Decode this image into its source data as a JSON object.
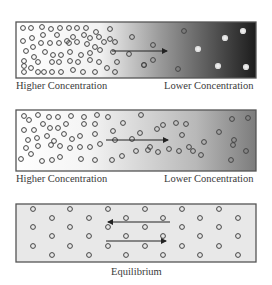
{
  "panels": [
    {
      "id": "diffusion-start",
      "box": {
        "x": 16,
        "y": 22,
        "w": 240,
        "h": 56
      },
      "gradient": {
        "stops": [
          [
            "0",
            "#ffffff"
          ],
          [
            "0.35",
            "#f2f2f2"
          ],
          [
            "0.6",
            "#9a9a9a"
          ],
          [
            "1",
            "#1c1c1c"
          ]
        ]
      },
      "labels": {
        "left": "Higher Concentration",
        "right": "Lower Concentration"
      },
      "arrows": [
        {
          "x1": 112,
          "y1": 51,
          "x2": 167,
          "y2": 51,
          "dir": "right"
        }
      ],
      "particles": [
        [
          23,
          28
        ],
        [
          31,
          28
        ],
        [
          42,
          27
        ],
        [
          51,
          29
        ],
        [
          60,
          28
        ],
        [
          69,
          28
        ],
        [
          77,
          28
        ],
        [
          86,
          28
        ],
        [
          96,
          32
        ],
        [
          110,
          29
        ],
        [
          23,
          41
        ],
        [
          32,
          38
        ],
        [
          43,
          35
        ],
        [
          57,
          35
        ],
        [
          67,
          41
        ],
        [
          73,
          37
        ],
        [
          84,
          35
        ],
        [
          90,
          38
        ],
        [
          99,
          37
        ],
        [
          110,
          39
        ],
        [
          132,
          37
        ],
        [
          26,
          51
        ],
        [
          33,
          47
        ],
        [
          41,
          43
        ],
        [
          50,
          43
        ],
        [
          59,
          43
        ],
        [
          69,
          43
        ],
        [
          77,
          42
        ],
        [
          87,
          44
        ],
        [
          95,
          47
        ],
        [
          104,
          42
        ],
        [
          115,
          42
        ],
        [
          24,
          61
        ],
        [
          34,
          57
        ],
        [
          45,
          52
        ],
        [
          53,
          55
        ],
        [
          61,
          55
        ],
        [
          70,
          52
        ],
        [
          81,
          55
        ],
        [
          90,
          53
        ],
        [
          100,
          50
        ],
        [
          113,
          52
        ],
        [
          153,
          45
        ],
        [
          24,
          66
        ],
        [
          38,
          62
        ],
        [
          52,
          62
        ],
        [
          59,
          62
        ],
        [
          70,
          61
        ],
        [
          78,
          62
        ],
        [
          90,
          60
        ],
        [
          99,
          62
        ],
        [
          117,
          62
        ],
        [
          129,
          54
        ],
        [
          24,
          72
        ],
        [
          31,
          68
        ],
        [
          38,
          72
        ],
        [
          44,
          72
        ],
        [
          52,
          72
        ],
        [
          61,
          72
        ],
        [
          73,
          70
        ],
        [
          83,
          72
        ],
        [
          95,
          72
        ],
        [
          107,
          68
        ],
        [
          115,
          72
        ],
        [
          144,
          65
        ],
        [
          184,
          31
        ],
        [
          243,
          31
        ],
        [
          225,
          38
        ],
        [
          198,
          49
        ],
        [
          246,
          67
        ],
        [
          218,
          66
        ],
        [
          178,
          69
        ],
        [
          153,
          60
        ],
        [
          144,
          65
        ]
      ]
    },
    {
      "id": "diffusion-mid",
      "box": {
        "x": 16,
        "y": 110,
        "w": 240,
        "h": 61
      },
      "gradient": {
        "stops": [
          [
            "0",
            "#ffffff"
          ],
          [
            "0.3",
            "#f4f4f4"
          ],
          [
            "0.75",
            "#b8b8b8"
          ],
          [
            "1",
            "#7c7c7c"
          ]
        ]
      },
      "labels": {
        "left": "Higher Concentration",
        "right": "Lower Concentration"
      },
      "arrows": [
        {
          "x1": 106,
          "y1": 140,
          "x2": 168,
          "y2": 140,
          "dir": "right"
        }
      ],
      "particles": [
        [
          24,
          116
        ],
        [
          29,
          120
        ],
        [
          38,
          115
        ],
        [
          49,
          117
        ],
        [
          58,
          117
        ],
        [
          71,
          116
        ],
        [
          84,
          117
        ],
        [
          97,
          115
        ],
        [
          108,
          117
        ],
        [
          141,
          115
        ],
        [
          24,
          130
        ],
        [
          34,
          130
        ],
        [
          43,
          124
        ],
        [
          50,
          128
        ],
        [
          58,
          128
        ],
        [
          66,
          124
        ],
        [
          84,
          124
        ],
        [
          95,
          124
        ],
        [
          123,
          123
        ],
        [
          28,
          140
        ],
        [
          37,
          138
        ],
        [
          47,
          136
        ],
        [
          54,
          141
        ],
        [
          64,
          134
        ],
        [
          72,
          139
        ],
        [
          80,
          136
        ],
        [
          95,
          134
        ],
        [
          113,
          131
        ],
        [
          26,
          148
        ],
        [
          38,
          146
        ],
        [
          51,
          145
        ],
        [
          60,
          146
        ],
        [
          70,
          148
        ],
        [
          80,
          147
        ],
        [
          90,
          147
        ],
        [
          100,
          144
        ],
        [
          115,
          140
        ],
        [
          132,
          139
        ],
        [
          21,
          159
        ],
        [
          31,
          154
        ],
        [
          42,
          161
        ],
        [
          52,
          160
        ],
        [
          60,
          157
        ],
        [
          81,
          159
        ],
        [
          95,
          160
        ],
        [
          112,
          160
        ],
        [
          122,
          156
        ],
        [
          163,
          125
        ],
        [
          176,
          123
        ],
        [
          186,
          124
        ],
        [
          140,
          133
        ],
        [
          157,
          129
        ],
        [
          182,
          135
        ],
        [
          150,
          147
        ],
        [
          169,
          149
        ],
        [
          179,
          151
        ],
        [
          136,
          151
        ],
        [
          148,
          150
        ],
        [
          158,
          152
        ],
        [
          193,
          151
        ],
        [
          201,
          155
        ],
        [
          189,
          147
        ],
        [
          204,
          142
        ],
        [
          219,
          132
        ],
        [
          232,
          119
        ],
        [
          248,
          118
        ],
        [
          233,
          145
        ],
        [
          246,
          151
        ],
        [
          231,
          160
        ],
        [
          234,
          140
        ]
      ]
    },
    {
      "id": "equilibrium",
      "box": {
        "x": 16,
        "y": 204,
        "w": 240,
        "h": 58
      },
      "gradient": {
        "stops": [
          [
            "0",
            "#e8e8e8"
          ],
          [
            "1",
            "#e8e8e8"
          ]
        ]
      },
      "labels": {
        "center": "Equilibrium"
      },
      "arrows": [
        {
          "x1": 108,
          "y1": 222,
          "x2": 170,
          "y2": 222,
          "dir": "left"
        },
        {
          "x1": 106,
          "y1": 241,
          "x2": 166,
          "y2": 241,
          "dir": "right"
        }
      ],
      "particles": [
        [
          33,
          209
        ],
        [
          70,
          209
        ],
        [
          108,
          209
        ],
        [
          145,
          209
        ],
        [
          182,
          209
        ],
        [
          219,
          209
        ],
        [
          52,
          218
        ],
        [
          89,
          218
        ],
        [
          126,
          218
        ],
        [
          163,
          218
        ],
        [
          200,
          218
        ],
        [
          238,
          218
        ],
        [
          33,
          227
        ],
        [
          70,
          227
        ],
        [
          108,
          227
        ],
        [
          145,
          227
        ],
        [
          182,
          227
        ],
        [
          219,
          227
        ],
        [
          52,
          236
        ],
        [
          89,
          236
        ],
        [
          126,
          236
        ],
        [
          163,
          236
        ],
        [
          200,
          236
        ],
        [
          238,
          236
        ],
        [
          33,
          246
        ],
        [
          70,
          246
        ],
        [
          108,
          246
        ],
        [
          145,
          246
        ],
        [
          182,
          246
        ],
        [
          219,
          246
        ],
        [
          52,
          255
        ],
        [
          89,
          255
        ],
        [
          126,
          255
        ],
        [
          163,
          255
        ],
        [
          200,
          255
        ],
        [
          238,
          255
        ]
      ]
    }
  ],
  "label_positions": {
    "p0_left": {
      "x": 16,
      "y": 80
    },
    "p0_right": {
      "x": 164,
      "y": 80
    },
    "p1_left": {
      "x": 16,
      "y": 173
    },
    "p1_right": {
      "x": 164,
      "y": 173
    },
    "p2_center": {
      "x": 111,
      "y": 266
    }
  }
}
